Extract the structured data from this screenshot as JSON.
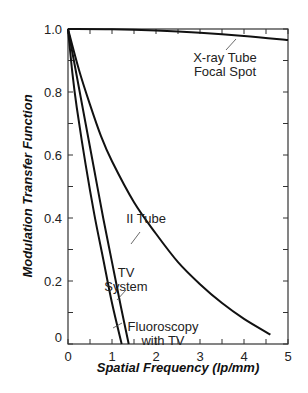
{
  "chart_data": {
    "type": "line",
    "title": "",
    "xlabel": "Spatial Frequency (lp/mm)",
    "ylabel": "Modulation Transfer Function",
    "xlim": [
      0,
      5
    ],
    "ylim": [
      0,
      1.0
    ],
    "x_ticks": [
      "0",
      "1",
      "2",
      "3",
      "4",
      "5"
    ],
    "y_ticks": [
      "0",
      "0.2",
      "0.4",
      "0.6",
      "0.8",
      "1.0"
    ],
    "y_origin_label": "0",
    "grid": false,
    "legend": "none (inline annotations)",
    "series": [
      {
        "name": "X-ray Tube Focal Spot",
        "label_lines": [
          "X-ray Tube",
          "Focal Spot"
        ],
        "x": [
          0,
          1,
          2,
          3,
          4,
          5
        ],
        "y": [
          1.0,
          0.999,
          0.995,
          0.988,
          0.978,
          0.965
        ]
      },
      {
        "name": "II Tube",
        "label_lines": [
          "II Tube"
        ],
        "x": [
          0,
          0.25,
          0.5,
          0.75,
          1.0,
          1.5,
          2.0,
          2.5,
          3.0,
          3.5,
          4.0,
          4.6
        ],
        "y": [
          1.0,
          0.87,
          0.76,
          0.66,
          0.58,
          0.45,
          0.35,
          0.26,
          0.19,
          0.13,
          0.08,
          0.03
        ]
      },
      {
        "name": "TV System",
        "label_lines": [
          "TV",
          "System"
        ],
        "x": [
          0,
          0.2,
          0.4,
          0.6,
          0.8,
          1.0,
          1.2,
          1.38
        ],
        "y": [
          1.0,
          0.85,
          0.7,
          0.55,
          0.4,
          0.26,
          0.12,
          0.0
        ]
      },
      {
        "name": "Fluoroscopy with TV",
        "label_lines": [
          "Fluoroscopy",
          "with TV"
        ],
        "x": [
          0,
          0.1,
          0.2,
          0.4,
          0.6,
          0.8,
          1.0,
          1.22
        ],
        "y": [
          1.0,
          0.86,
          0.75,
          0.57,
          0.41,
          0.27,
          0.13,
          0.0
        ]
      }
    ]
  }
}
